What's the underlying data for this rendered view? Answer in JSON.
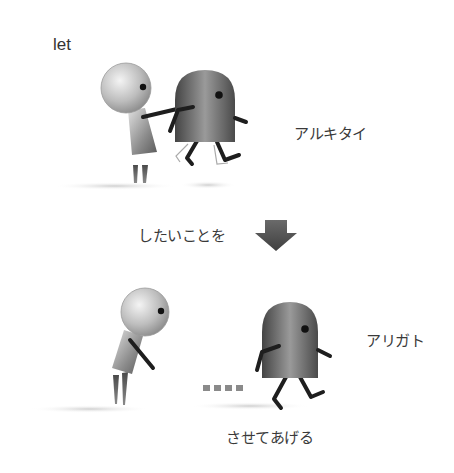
{
  "labels": {
    "let": "let",
    "walk_want": "アルキタイ",
    "what_want": "したいことを",
    "thanks": "アリガト",
    "let_do": "させてあげる"
  },
  "panels": {
    "top": {
      "description": "round-headed figure pushes dome-shaped figure who starts walking",
      "characters": [
        "round-head-figure",
        "dome-figure"
      ]
    },
    "transition": {
      "arrow": "down-arrow-icon"
    },
    "bottom": {
      "description": "round-headed figure bows while dome-shaped figure walks away",
      "characters": [
        "round-head-figure-bowing",
        "dome-figure-walking"
      ],
      "trail_dots": 4
    }
  },
  "colors": {
    "ink": "#222222",
    "body_dark": "#5a5a5a",
    "body_light": "#d8d8d8",
    "shadow": "#d6d6d6",
    "arrow": "#555555",
    "dots": "#8a8a8a"
  }
}
